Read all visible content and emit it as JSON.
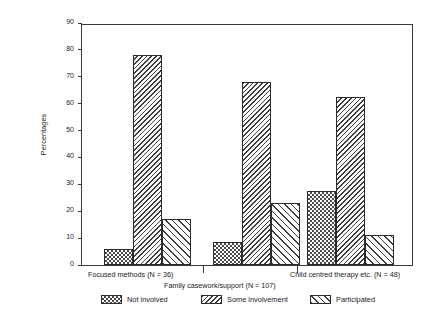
{
  "chart_data": {
    "type": "bar",
    "title": "",
    "xlabel": "",
    "ylabel": "Percentages",
    "ylim": [
      0,
      90
    ],
    "ytick_step": 10,
    "yticks": [
      0,
      10,
      20,
      30,
      40,
      50,
      60,
      70,
      80,
      90
    ],
    "grid": false,
    "legend_position": "bottom",
    "categories": [
      "Focused methods (N = 36)",
      "Family casework/support (N = 107)",
      "Child centred therapy etc. (N = 48)"
    ],
    "series": [
      {
        "name": "Not involved",
        "values": [
          6,
          8.5,
          27.5
        ]
      },
      {
        "name": "Some involvement",
        "values": [
          78,
          68,
          62.5
        ]
      },
      {
        "name": "Participated",
        "values": [
          17,
          23,
          11
        ]
      }
    ]
  },
  "legend": {
    "items": [
      {
        "label": "Not involved",
        "pattern": "checkerboard-swatch"
      },
      {
        "label": "Some involvement",
        "pattern": "dense-hatch-swatch"
      },
      {
        "label": "Participated",
        "pattern": "sparse-hatch-swatch"
      }
    ]
  },
  "axes": {
    "y_title": "Percentages"
  }
}
